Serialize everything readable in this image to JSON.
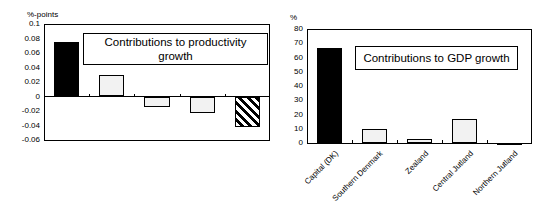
{
  "chart_data": [
    {
      "type": "bar",
      "title": "Contributions to productivity growth",
      "ylabel": "%-points",
      "xlabel": "",
      "categories": [
        "Capital (DK)",
        "Southern Denmark",
        "Zealand",
        "Central Jutland",
        "Northern Jutland"
      ],
      "values": [
        0.075,
        0.029,
        -0.014,
        -0.023,
        -0.042
      ],
      "ylim": [
        -0.06,
        0.1
      ],
      "yticks": [
        "0.1",
        "0.08",
        "0.06",
        "0.04",
        "0.02",
        "0",
        "-0.02",
        "-0.04",
        "-0.06"
      ],
      "bar_styles": [
        "black",
        "light",
        "light",
        "light",
        "hatched"
      ],
      "grid": false,
      "legend_position": "inside-top-right"
    },
    {
      "type": "bar",
      "title": "Contributions to GDP growth",
      "ylabel": "%",
      "xlabel": "",
      "categories": [
        "Capital (DK)",
        "Southern Denmark",
        "Zealand",
        "Central Jutland",
        "Northern Jutland"
      ],
      "values": [
        67,
        10,
        3,
        17,
        -0.5
      ],
      "ylim": [
        0,
        80
      ],
      "yticks": [
        "80",
        "70",
        "60",
        "50",
        "40",
        "30",
        "20",
        "10",
        "0"
      ],
      "bar_styles": [
        "black",
        "light",
        "light",
        "light",
        "light"
      ],
      "grid": false,
      "legend_position": "inside-top-right"
    }
  ],
  "colors": {
    "dark_bar": "#000000",
    "light_bar": "#f2f2f2",
    "frame": "#000000"
  }
}
